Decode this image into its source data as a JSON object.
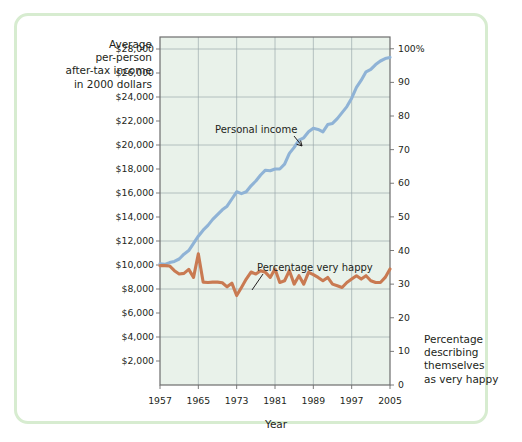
{
  "figure": {
    "border_color": "#d7ecd0",
    "plot_bg": "#e9f2ea",
    "grid_color": "#9aa8ac",
    "axis_color": "#6d6d6d"
  },
  "axes": {
    "left_title": [
      "Average",
      "per-person",
      "after-tax income",
      "in 2000 dollars"
    ],
    "right_title": [
      "Percentage",
      "describing",
      "themselves",
      "as very happy"
    ],
    "x_title": "Year",
    "left_ticks": [
      "$2,000",
      "$4,000",
      "$6,000",
      "$8,000",
      "$10,000",
      "$12,000",
      "$14,000",
      "$16,000",
      "$18,000",
      "$20,000",
      "$22,000",
      "$24,000",
      "$26,000",
      "$28,000"
    ],
    "right_ticks": [
      "0",
      "10",
      "20",
      "30",
      "40",
      "50",
      "60",
      "70",
      "80",
      "90",
      "100%"
    ],
    "x_ticks": [
      "1957",
      "1965",
      "1973",
      "1981",
      "1989",
      "1997",
      "2005"
    ]
  },
  "annotations": {
    "income_label": "Personal income",
    "happy_label": "Percentage very happy"
  },
  "chart_data": {
    "type": "line",
    "title": "",
    "xlabel": "Year",
    "ylabel": "Average per-person after-tax income in 2000 dollars",
    "ylabel_right": "Percentage describing themselves as very happy",
    "xlim": [
      1957,
      2005
    ],
    "ylim_left": [
      0,
      29000
    ],
    "ylim_right": [
      0,
      103.5
    ],
    "grid": true,
    "legend": "inline-annotations",
    "x": [
      1957,
      1958,
      1959,
      1960,
      1961,
      1962,
      1963,
      1964,
      1965,
      1966,
      1967,
      1968,
      1969,
      1970,
      1971,
      1972,
      1973,
      1974,
      1975,
      1976,
      1977,
      1978,
      1979,
      1980,
      1981,
      1982,
      1983,
      1984,
      1985,
      1986,
      1987,
      1988,
      1989,
      1990,
      1991,
      1992,
      1993,
      1994,
      1995,
      1996,
      1997,
      1998,
      1999,
      2000,
      2001,
      2002,
      2003,
      2004,
      2005
    ],
    "series": [
      {
        "name": "Personal income",
        "color": "#8fb3d6",
        "axis": "left",
        "unit": "2000 dollars",
        "values": [
          10100,
          10050,
          10200,
          10300,
          10500,
          10900,
          11200,
          11800,
          12400,
          12900,
          13300,
          13800,
          14200,
          14600,
          14900,
          15500,
          16100,
          15950,
          16100,
          16600,
          17000,
          17500,
          17900,
          17850,
          18000,
          18000,
          18400,
          19300,
          19800,
          20400,
          20600,
          21100,
          21400,
          21300,
          21100,
          21700,
          21800,
          22200,
          22700,
          23200,
          23900,
          24800,
          25400,
          26100,
          26300,
          26700,
          27000,
          27200,
          27300
        ]
      },
      {
        "name": "Percentage very happy",
        "color": "#c97a52",
        "axis": "right",
        "unit": "percent",
        "values": [
          35.5,
          35.5,
          35.4,
          34.0,
          33.0,
          33.2,
          34.4,
          32.0,
          39.0,
          30.6,
          30.5,
          30.6,
          30.6,
          30.4,
          29.2,
          30.3,
          26.6,
          29.0,
          31.5,
          33.6,
          33.0,
          34.0,
          33.5,
          32.0,
          34.5,
          30.5,
          31.0,
          34.0,
          30.0,
          32.5,
          30.0,
          33.5,
          32.8,
          32.0,
          31.0,
          32.0,
          30.0,
          29.5,
          29.0,
          30.5,
          31.5,
          32.5,
          31.5,
          32.5,
          31.0,
          30.5,
          30.5,
          32.0,
          34.5
        ]
      }
    ]
  }
}
